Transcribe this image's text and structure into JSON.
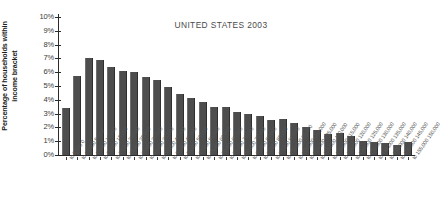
{
  "chart_data": {
    "type": "bar",
    "title": "UNITED STATES 2003",
    "xlabel": "",
    "ylabel": "Percentage of households within income bracket",
    "ylabel_line1": "Percentage of households within",
    "ylabel_line2": "income bracket",
    "ylim": [
      0,
      10
    ],
    "ytick_labels": [
      "10%",
      "9%",
      "8%",
      "7%",
      "6%",
      "5%",
      "4%",
      "3%",
      "2%",
      "1%",
      "0%"
    ],
    "ytick_values": [
      10,
      9,
      8,
      7,
      6,
      5,
      4,
      3,
      2,
      1,
      0
    ],
    "grid": false,
    "legend": null,
    "bar_color": "#4d4d4d",
    "axis_color": "#2b2b2b",
    "categories": [
      "0 to 5,000",
      "5,000 to 10,000",
      "10,000 to 15,000",
      "15,000 to 20,000",
      "20,000 to 25,000",
      "25,000 to 30,000",
      "30,000 to 35,000",
      "35,000 to 40,000",
      "40,000 to 45,000",
      "45,000 to 50,000",
      "50,000 to 55,000",
      "55,000 to 60,000",
      "60,000 to 65,000",
      "65,000 to 70,000",
      "70,000 to 75,000",
      "75,000 to 80,000",
      "80,000 to 85,000",
      "85,000 to 90,000",
      "90,000 to 95,000",
      "95,000 to 100,000",
      "100,000 to 105,000",
      "105,000 to 110,000",
      "110,000 to 115,000",
      "115,000 to 120,000",
      "120,000 to 125,000",
      "125,000 to 130,000",
      "130,000 to 135,000",
      "135,000 to 140,000",
      "140,000 to 145,000",
      "145,000 to 150,000",
      "150,000 to 155,000"
    ],
    "values": [
      3.4,
      5.7,
      7.0,
      6.85,
      6.4,
      6.1,
      6.0,
      5.65,
      5.45,
      4.95,
      4.45,
      4.15,
      3.85,
      3.5,
      3.45,
      3.1,
      2.95,
      2.8,
      2.55,
      2.6,
      2.3,
      2.0,
      1.8,
      1.55,
      1.6,
      1.35,
      1.05,
      0.95,
      0.9,
      0.7,
      0.95
    ]
  }
}
